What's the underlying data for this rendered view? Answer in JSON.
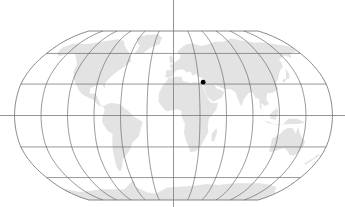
{
  "map": {
    "projection": "Robinson",
    "colors": {
      "background": "#ffffff",
      "land": "#e3e3e3",
      "graticule": "#6a6a6a",
      "axis": "#7a7a7a",
      "marker": "#000000"
    },
    "graticule": {
      "meridian_step_deg": 30,
      "parallel_step_deg": 30
    },
    "crosshair_axes": {
      "horizontal": "equator",
      "vertical": "prime-meridian"
    },
    "markers": [
      {
        "name": "location-marker",
        "lat": 31.8,
        "lon": 35.2
      }
    ],
    "continents": [
      {
        "name": "north-america",
        "coords": [
          [
            -168,
            66
          ],
          [
            -160,
            71
          ],
          [
            -140,
            70
          ],
          [
            -125,
            72
          ],
          [
            -110,
            74
          ],
          [
            -95,
            76
          ],
          [
            -82,
            74
          ],
          [
            -75,
            68
          ],
          [
            -62,
            60
          ],
          [
            -56,
            52
          ],
          [
            -65,
            45
          ],
          [
            -70,
            42
          ],
          [
            -76,
            37
          ],
          [
            -81,
            31
          ],
          [
            -80,
            25
          ],
          [
            -84,
            30
          ],
          [
            -90,
            29
          ],
          [
            -97,
            26
          ],
          [
            -97,
            21
          ],
          [
            -90,
            21
          ],
          [
            -87,
            17
          ],
          [
            -83,
            10
          ],
          [
            -79,
            8
          ],
          [
            -84,
            9
          ],
          [
            -92,
            15
          ],
          [
            -105,
            20
          ],
          [
            -110,
            24
          ],
          [
            -115,
            30
          ],
          [
            -120,
            35
          ],
          [
            -124,
            42
          ],
          [
            -125,
            49
          ],
          [
            -132,
            55
          ],
          [
            -140,
            60
          ],
          [
            -150,
            60
          ],
          [
            -158,
            57
          ],
          [
            -165,
            60
          ]
        ]
      },
      {
        "name": "greenland",
        "coords": [
          [
            -55,
            60
          ],
          [
            -44,
            60
          ],
          [
            -35,
            66
          ],
          [
            -22,
            70
          ],
          [
            -20,
            78
          ],
          [
            -30,
            83
          ],
          [
            -50,
            82
          ],
          [
            -65,
            78
          ],
          [
            -58,
            72
          ],
          [
            -52,
            68
          ]
        ]
      },
      {
        "name": "south-america",
        "coords": [
          [
            -80,
            9
          ],
          [
            -72,
            12
          ],
          [
            -62,
            11
          ],
          [
            -52,
            5
          ],
          [
            -45,
            -1
          ],
          [
            -35,
            -6
          ],
          [
            -37,
            -12
          ],
          [
            -40,
            -20
          ],
          [
            -48,
            -26
          ],
          [
            -52,
            -33
          ],
          [
            -58,
            -38
          ],
          [
            -63,
            -42
          ],
          [
            -66,
            -48
          ],
          [
            -69,
            -52
          ],
          [
            -72,
            -54
          ],
          [
            -74,
            -50
          ],
          [
            -73,
            -42
          ],
          [
            -72,
            -30
          ],
          [
            -70,
            -18
          ],
          [
            -76,
            -14
          ],
          [
            -81,
            -6
          ],
          [
            -80,
            0
          ],
          [
            -78,
            5
          ]
        ]
      },
      {
        "name": "eurasia",
        "coords": [
          [
            -10,
            36
          ],
          [
            -9,
            43
          ],
          [
            -2,
            44
          ],
          [
            -5,
            48
          ],
          [
            2,
            51
          ],
          [
            8,
            54
          ],
          [
            10,
            58
          ],
          [
            5,
            62
          ],
          [
            12,
            66
          ],
          [
            20,
            70
          ],
          [
            30,
            71
          ],
          [
            42,
            68
          ],
          [
            55,
            70
          ],
          [
            68,
            73
          ],
          [
            80,
            73
          ],
          [
            100,
            77
          ],
          [
            115,
            74
          ],
          [
            130,
            72
          ],
          [
            145,
            72
          ],
          [
            160,
            70
          ],
          [
            175,
            68
          ],
          [
            180,
            66
          ],
          [
            178,
            62
          ],
          [
            165,
            60
          ],
          [
            160,
            55
          ],
          [
            155,
            58
          ],
          [
            142,
            54
          ],
          [
            140,
            47
          ],
          [
            133,
            43
          ],
          [
            128,
            38
          ],
          [
            126,
            35
          ],
          [
            121,
            31
          ],
          [
            122,
            25
          ],
          [
            115,
            22
          ],
          [
            108,
            21
          ],
          [
            106,
            15
          ],
          [
            109,
            11
          ],
          [
            104,
            9
          ],
          [
            100,
            12
          ],
          [
            100,
            6
          ],
          [
            103,
            1
          ],
          [
            98,
            8
          ],
          [
            98,
            16
          ],
          [
            94,
            17
          ],
          [
            91,
            23
          ],
          [
            86,
            21
          ],
          [
            80,
            15
          ],
          [
            77,
            8
          ],
          [
            73,
            18
          ],
          [
            72,
            22
          ],
          [
            67,
            25
          ],
          [
            60,
            25
          ],
          [
            57,
            26
          ],
          [
            52,
            28
          ],
          [
            48,
            30
          ],
          [
            50,
            26
          ],
          [
            56,
            24
          ],
          [
            59,
            22
          ],
          [
            55,
            17
          ],
          [
            45,
            13
          ],
          [
            42,
            16
          ],
          [
            38,
            22
          ],
          [
            35,
            28
          ],
          [
            34,
            31
          ],
          [
            35,
            36
          ],
          [
            30,
            37
          ],
          [
            27,
            40
          ],
          [
            23,
            38
          ],
          [
            22,
            41
          ],
          [
            19,
            42
          ],
          [
            16,
            41
          ],
          [
            18,
            40
          ],
          [
            12,
            44
          ],
          [
            8,
            44
          ],
          [
            3,
            43
          ],
          [
            -2,
            37
          ]
        ]
      },
      {
        "name": "africa",
        "coords": [
          [
            -17,
            21
          ],
          [
            -13,
            28
          ],
          [
            -9,
            32
          ],
          [
            -6,
            36
          ],
          [
            3,
            37
          ],
          [
            10,
            37
          ],
          [
            11,
            33
          ],
          [
            20,
            31
          ],
          [
            25,
            32
          ],
          [
            32,
            31
          ],
          [
            34,
            28
          ],
          [
            38,
            18
          ],
          [
            43,
            12
          ],
          [
            51,
            12
          ],
          [
            48,
            5
          ],
          [
            40,
            -3
          ],
          [
            39,
            -10
          ],
          [
            40,
            -16
          ],
          [
            35,
            -24
          ],
          [
            32,
            -29
          ],
          [
            27,
            -34
          ],
          [
            20,
            -35
          ],
          [
            18,
            -30
          ],
          [
            15,
            -25
          ],
          [
            12,
            -17
          ],
          [
            13,
            -8
          ],
          [
            9,
            -1
          ],
          [
            9,
            4
          ],
          [
            5,
            6
          ],
          [
            -2,
            5
          ],
          [
            -8,
            4
          ],
          [
            -13,
            8
          ],
          [
            -17,
            13
          ]
        ]
      },
      {
        "name": "madagascar",
        "coords": [
          [
            44,
            -17
          ],
          [
            49,
            -12
          ],
          [
            50,
            -16
          ],
          [
            47,
            -25
          ],
          [
            44,
            -24
          ]
        ]
      },
      {
        "name": "arabia-link",
        "coords": [
          [
            35,
            28
          ],
          [
            38,
            18
          ],
          [
            42,
            16
          ],
          [
            45,
            13
          ],
          [
            38,
            22
          ]
        ]
      },
      {
        "name": "australia",
        "coords": [
          [
            114,
            -22
          ],
          [
            114,
            -34
          ],
          [
            118,
            -35
          ],
          [
            124,
            -33
          ],
          [
            131,
            -31
          ],
          [
            138,
            -35
          ],
          [
            141,
            -38
          ],
          [
            147,
            -38
          ],
          [
            150,
            -36
          ],
          [
            153,
            -28
          ],
          [
            153,
            -25
          ],
          [
            146,
            -19
          ],
          [
            142,
            -11
          ],
          [
            140,
            -17
          ],
          [
            136,
            -12
          ],
          [
            130,
            -12
          ],
          [
            126,
            -14
          ],
          [
            122,
            -18
          ]
        ]
      },
      {
        "name": "indonesia",
        "coords": [
          [
            95,
            5
          ],
          [
            104,
            -5
          ],
          [
            114,
            -8
          ],
          [
            124,
            -9
          ],
          [
            130,
            -3
          ],
          [
            140,
            -3
          ],
          [
            150,
            -7
          ],
          [
            142,
            -8
          ],
          [
            131,
            -8
          ],
          [
            118,
            -9
          ],
          [
            106,
            -7
          ],
          [
            100,
            -1
          ]
        ]
      },
      {
        "name": "borneo",
        "coords": [
          [
            109,
            1
          ],
          [
            117,
            7
          ],
          [
            119,
            4
          ],
          [
            116,
            -4
          ],
          [
            110,
            -3
          ]
        ]
      },
      {
        "name": "japan",
        "coords": [
          [
            130,
            31
          ],
          [
            135,
            34
          ],
          [
            140,
            36
          ],
          [
            142,
            40
          ],
          [
            141,
            45
          ],
          [
            139,
            41
          ],
          [
            135,
            35
          ],
          [
            130,
            34
          ]
        ]
      },
      {
        "name": "uk",
        "coords": [
          [
            -5,
            50
          ],
          [
            1,
            51
          ],
          [
            0,
            54
          ],
          [
            -3,
            58
          ],
          [
            -6,
            57
          ],
          [
            -5,
            54
          ]
        ]
      },
      {
        "name": "new-zealand",
        "coords": [
          [
            166,
            -46
          ],
          [
            172,
            -41
          ],
          [
            175,
            -37
          ],
          [
            178,
            -38
          ],
          [
            174,
            -42
          ],
          [
            169,
            -47
          ]
        ]
      },
      {
        "name": "antarctica",
        "coords": [
          [
            -180,
            -72
          ],
          [
            -160,
            -76
          ],
          [
            -140,
            -75
          ],
          [
            -120,
            -73
          ],
          [
            -100,
            -73
          ],
          [
            -80,
            -73
          ],
          [
            -65,
            -66
          ],
          [
            -58,
            -63
          ],
          [
            -60,
            -70
          ],
          [
            -45,
            -77
          ],
          [
            -30,
            -78
          ],
          [
            -10,
            -71
          ],
          [
            10,
            -70
          ],
          [
            30,
            -69
          ],
          [
            50,
            -67
          ],
          [
            70,
            -68
          ],
          [
            90,
            -66
          ],
          [
            110,
            -66
          ],
          [
            130,
            -66
          ],
          [
            150,
            -68
          ],
          [
            165,
            -71
          ],
          [
            170,
            -75
          ],
          [
            180,
            -78
          ],
          [
            180,
            -90
          ],
          [
            -180,
            -90
          ]
        ]
      }
    ]
  }
}
